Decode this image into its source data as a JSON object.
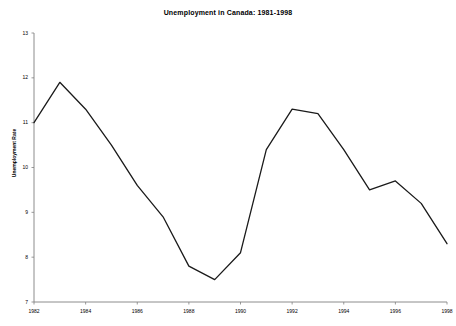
{
  "chart_data": {
    "type": "line",
    "title": "Unemployment in Canada: 1981-1998",
    "xlabel": "",
    "ylabel": "Unemployment Rate",
    "x": [
      1982,
      1983,
      1984,
      1985,
      1986,
      1987,
      1988,
      1989,
      1990,
      1991,
      1992,
      1993,
      1994,
      1995,
      1996,
      1997,
      1998
    ],
    "values": [
      11.0,
      11.9,
      11.3,
      10.5,
      9.6,
      8.9,
      7.8,
      7.5,
      8.1,
      10.4,
      11.3,
      11.2,
      10.4,
      9.5,
      9.7,
      9.2,
      8.3
    ],
    "series": [
      {
        "name": "Unemployment Rate",
        "values": [
          11.0,
          11.9,
          11.3,
          10.5,
          9.6,
          8.9,
          7.8,
          7.5,
          8.1,
          10.4,
          11.3,
          11.2,
          10.4,
          9.5,
          9.7,
          9.2,
          8.3
        ]
      }
    ],
    "xlim": [
      1982,
      1998
    ],
    "ylim": [
      7,
      13
    ],
    "ytick_labels": [
      "7",
      "8",
      "9",
      "10",
      "11",
      "12",
      "13"
    ],
    "ytick_values": [
      7,
      8,
      9,
      10,
      11,
      12,
      13
    ],
    "xtick_labels": [
      "1982",
      "1984",
      "1986",
      "1988",
      "1990",
      "1992",
      "1994",
      "1996",
      "1998"
    ],
    "xtick_values": [
      1982,
      1984,
      1986,
      1988,
      1990,
      1992,
      1994,
      1996,
      1998
    ],
    "grid": false,
    "legend": "none",
    "line_color": "#1a1a1a",
    "axis_color": "#808080",
    "background_color": "#ffffff"
  }
}
